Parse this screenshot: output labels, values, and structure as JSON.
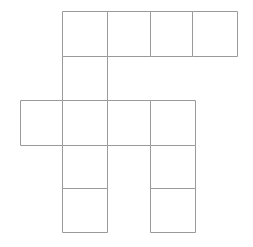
{
  "figure": {
    "canvas": {
      "width": 253,
      "height": 247,
      "background": "#ffffff"
    },
    "stroke": {
      "color": "#9a9a9a",
      "width": 1
    },
    "fill": "#ffffff",
    "grid": {
      "column_edges": [
        20,
        62,
        107,
        150,
        195
      ],
      "row_edges": [
        11,
        56,
        100,
        145,
        188,
        232
      ],
      "columns": 4,
      "rows": 5
    },
    "cell_count": 11,
    "cells": [
      {
        "name": "cell-r1c2",
        "row": 1,
        "col": 2,
        "x": 62,
        "y": 11,
        "w": 45,
        "h": 45
      },
      {
        "name": "cell-r1c3",
        "row": 1,
        "col": 3,
        "x": 107,
        "y": 11,
        "w": 43,
        "h": 45
      },
      {
        "name": "cell-r1c4",
        "row": 1,
        "col": 4,
        "x": 150,
        "y": 11,
        "w": 42,
        "h": 45
      },
      {
        "name": "cell-r1c5",
        "row": 1,
        "col": 5,
        "x": 192,
        "y": 11,
        "w": 45,
        "h": 45
      },
      {
        "name": "cell-r2c2",
        "row": 2,
        "col": 2,
        "x": 62,
        "y": 56,
        "w": 45,
        "h": 44
      },
      {
        "name": "cell-r3c1",
        "row": 3,
        "col": 1,
        "x": 20,
        "y": 100,
        "w": 42,
        "h": 45
      },
      {
        "name": "cell-r3c2",
        "row": 3,
        "col": 2,
        "x": 62,
        "y": 100,
        "w": 45,
        "h": 45
      },
      {
        "name": "cell-r3c3",
        "row": 3,
        "col": 3,
        "x": 107,
        "y": 100,
        "w": 43,
        "h": 45
      },
      {
        "name": "cell-r3c4",
        "row": 3,
        "col": 4,
        "x": 150,
        "y": 100,
        "w": 45,
        "h": 45
      },
      {
        "name": "cell-r4c2",
        "row": 4,
        "col": 2,
        "x": 62,
        "y": 145,
        "w": 45,
        "h": 43
      },
      {
        "name": "cell-r4c4",
        "row": 4,
        "col": 4,
        "x": 150,
        "y": 145,
        "w": 45,
        "h": 43
      },
      {
        "name": "cell-r5c2",
        "row": 5,
        "col": 2,
        "x": 62,
        "y": 188,
        "w": 45,
        "h": 44
      },
      {
        "name": "cell-r5c4",
        "row": 5,
        "col": 4,
        "x": 150,
        "y": 188,
        "w": 45,
        "h": 44
      }
    ]
  }
}
